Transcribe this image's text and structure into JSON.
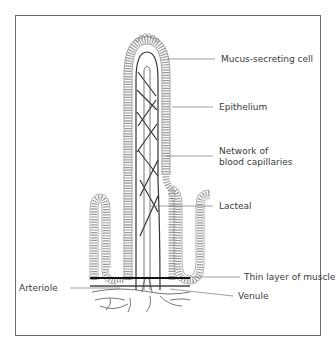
{
  "diagram": {
    "type": "labelled anatomical diagram",
    "colors": {
      "line": "#3a3a3a",
      "frame": "#6a6a6a",
      "background": "#ffffff"
    },
    "labels": {
      "mucus_cell": "Mucus-secreting cell",
      "epithelium": "Epithelium",
      "capillaries_line1": "Network of",
      "capillaries_line2": "blood capillaries",
      "lacteal": "Lacteal",
      "muscle": "Thin layer of muscle",
      "arteriole": "Arteriole",
      "venule": "Venule"
    }
  }
}
